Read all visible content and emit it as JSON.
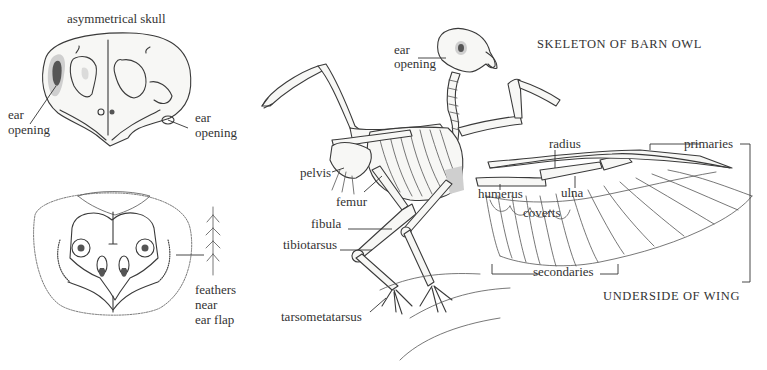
{
  "figure": {
    "title": "SKELETON OF BARN OWL",
    "wing_caption": "UNDERSIDE OF WING",
    "skull": {
      "title": "asymmetrical skull",
      "left_ear_label_line1": "ear",
      "left_ear_label_line2": "opening",
      "right_ear_label_line1": "ear",
      "right_ear_label_line2": "opening"
    },
    "face": {
      "feather_label_line1": "feathers",
      "feather_label_line2": "near",
      "feather_label_line3": "ear flap"
    },
    "skeleton_labels": {
      "ear_line1": "ear",
      "ear_line2": "opening",
      "pelvis": "pelvis",
      "femur": "femur",
      "fibula": "fibula",
      "tibiotarsus": "tibiotarsus",
      "tarsometatarsus": "tarsometatarsus"
    },
    "wing_labels": {
      "radius": "radius",
      "ulna": "ulna",
      "humerus": "humerus",
      "coverts": "coverts",
      "primaries": "primaries",
      "secondaries": "secondaries"
    }
  }
}
